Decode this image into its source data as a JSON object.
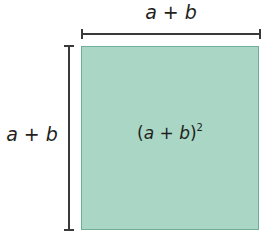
{
  "diagram": {
    "top_label": {
      "a": "a",
      "op": " + ",
      "b": "b"
    },
    "left_label": {
      "a": "a",
      "op": " + ",
      "b": "b"
    },
    "center_label": {
      "open": "(",
      "a": "a",
      "op": " + ",
      "b": "b",
      "close": ")",
      "exponent": "2"
    },
    "colors": {
      "fill": "#a9d6c5",
      "border": "#6fae97",
      "bracket": "#3a3a3a"
    }
  }
}
